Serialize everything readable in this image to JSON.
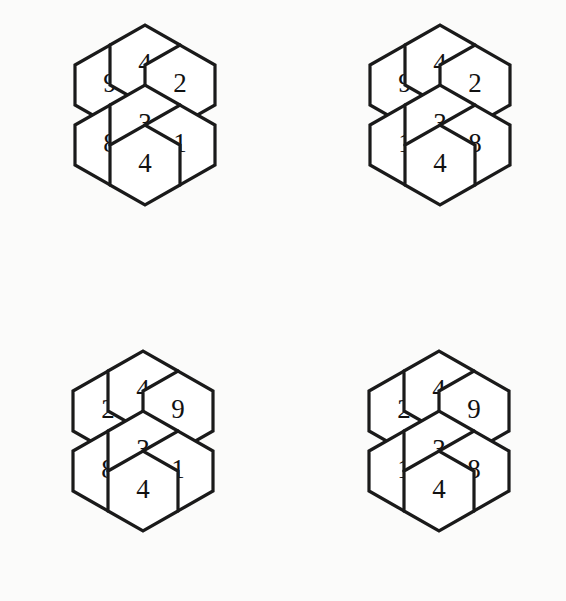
{
  "page": {
    "background_color": "#fbfbfa",
    "ink_color": "#1a1a1a",
    "cell_fill_color": "#ffffff",
    "figure_type": "hexagon-number-puzzle-grid",
    "cluster_count": 4,
    "cells_per_cluster": 7
  },
  "clusters": [
    {
      "id": "cluster-top-left",
      "position": {
        "left": 42,
        "top": 31,
        "width": 201,
        "height": 212
      },
      "cells": {
        "top": "4",
        "upper_left": "9",
        "upper_right": "2",
        "center": "3",
        "lower_left": "8",
        "lower_right": "1",
        "bottom": "4"
      }
    },
    {
      "id": "cluster-top-right",
      "position": {
        "left": 337,
        "top": 31,
        "width": 196,
        "height": 214
      },
      "cells": {
        "top": "4",
        "upper_left": "9",
        "upper_right": "2",
        "center": "3",
        "lower_left": "1",
        "lower_right": "8",
        "bottom": "4"
      }
    },
    {
      "id": "cluster-bottom-left",
      "position": {
        "left": 40,
        "top": 357,
        "width": 198,
        "height": 211
      },
      "cells": {
        "top": "4",
        "upper_left": "2",
        "upper_right": "9",
        "center": "3",
        "lower_left": "8",
        "lower_right": "1",
        "bottom": "4"
      }
    },
    {
      "id": "cluster-bottom-right",
      "position": {
        "left": 336,
        "top": 357,
        "width": 192,
        "height": 211
      },
      "cells": {
        "top": "4",
        "upper_left": "2",
        "upper_right": "9",
        "center": "3",
        "lower_left": "1",
        "lower_right": "8",
        "bottom": "4"
      }
    }
  ]
}
